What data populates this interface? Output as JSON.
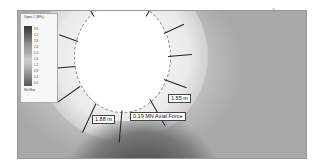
{
  "figure": {
    "type": "tunnel-stress-contour",
    "legend": {
      "title": "Sigma 1 (MPa)",
      "ticks": [
        "-0.4",
        "0.0",
        "0.4",
        "0.8",
        "1.2",
        "1.6",
        "2.0",
        "2.4",
        "2.8",
        "3.2",
        "3.6"
      ],
      "footer": "Min/Max"
    },
    "labels": {
      "bolt_length_right": "1.55 m",
      "bolt_length_left": "1.88 m",
      "axial_force": "0.19 MN Axial Force"
    },
    "x_ticks": [
      "",
      "",
      "",
      "",
      "",
      "",
      "",
      "",
      "",
      "",
      ""
    ],
    "y_ticks": [
      "",
      "",
      "",
      "",
      "",
      "",
      ""
    ]
  }
}
